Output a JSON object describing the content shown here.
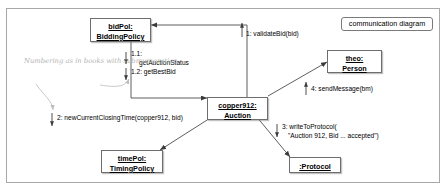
{
  "diagram": {
    "kind_label": "communication diagram",
    "annotation": {
      "line1": "Numbering as in books",
      "line2": "with submumeration"
    }
  },
  "objects": [
    {
      "name": "bidPol-biddingpolicy",
      "line1": "bidPol:",
      "line2": "BiddingPolicy"
    },
    {
      "name": "copper912-auction",
      "line1": "copper912:",
      "line2": "Auction"
    },
    {
      "name": "theo-person",
      "line1": "theo:",
      "line2": "Person"
    },
    {
      "name": "timepol-timingpolicy",
      "line1": "timePol:",
      "line2": "TimingPolicy"
    },
    {
      "name": "protocol",
      "line1": ":Protocol",
      "line2": ""
    }
  ],
  "messages": [
    {
      "name": "message-1-validatebid",
      "number": "1:",
      "text": "1: validateBid(bid)",
      "line2": ""
    },
    {
      "name": "message-1-1-getauctionstatus",
      "number": "1.1:",
      "text": "1.1:",
      "line2": "getAuctionStatus"
    },
    {
      "name": "message-1-2-getbestbid",
      "number": "1.2:",
      "text": "1.2: getBestBid",
      "line2": ""
    },
    {
      "name": "message-2-newcurrentclosingtime",
      "number": "2:",
      "text": "2: newCurrentClosingTime(copper912, bid)",
      "line2": ""
    },
    {
      "name": "message-3-writetoprotocol",
      "number": "3:",
      "text": "3: writeToProtocol(",
      "line2": "\"Auction 912, Bid ... accepted\")"
    },
    {
      "name": "message-4-sendmessage",
      "number": "4:",
      "text": "4: sendMessage(bm)",
      "line2": ""
    }
  ],
  "colors": {
    "frame_border": "#a8a8a8",
    "box_border": "#6e6e6e",
    "link_line": "#4d4d4d",
    "annotation_text": "#b2b2b2"
  }
}
